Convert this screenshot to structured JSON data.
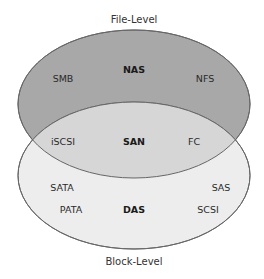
{
  "diagram": {
    "type": "venn",
    "title_top": "File-Level",
    "title_bottom": "Block-Level",
    "colors": {
      "top_fill": "#a8a8a8",
      "intersection_fill": "#d6d6d6",
      "bottom_fill": "#ededed",
      "stroke": "#666666"
    },
    "sets": {
      "top": {
        "name": "NAS",
        "items": [
          "SMB",
          "NFS"
        ]
      },
      "intersection": {
        "name": "SAN",
        "items": [
          "iSCSI",
          "FC"
        ]
      },
      "bottom": {
        "name": "DAS",
        "items": [
          "SATA",
          "SAS",
          "PATA",
          "SCSI"
        ]
      }
    }
  }
}
